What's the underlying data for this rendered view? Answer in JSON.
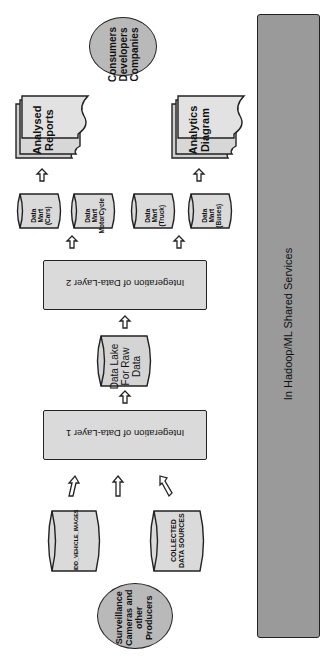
{
  "diagram": {
    "orientation": "rotated 90deg (text reads bottom-to-top / top-to-bottom)",
    "shared_services": {
      "label": "In Hadoop/ML Shared Services"
    },
    "consumers": {
      "label": "Consumers\nDevelopers\nCompanies"
    },
    "outputs": [
      {
        "label": "Analysed\nReports"
      },
      {
        "label": "Analytics\nDiagram"
      }
    ],
    "data_marts": [
      {
        "label": "Data\nMart\n(Cars)"
      },
      {
        "label": "Data\nMart\nMotorCycle"
      },
      {
        "label": "Data\nMart\n(Truck)"
      },
      {
        "label": "Data\nMart\n(Buses)"
      }
    ],
    "integration_layer_2": {
      "label": "Integeration of Data-Layer 2"
    },
    "data_lake": {
      "label": "Data Lake\nFor Raw\nData"
    },
    "integration_layer_1": {
      "label": "Integeration of Data-Layer 1"
    },
    "sources": [
      {
        "label": "IDD_VEHICLE_IMAGES"
      },
      {
        "label": "COLLECTED\nDATA SOURCES"
      }
    ],
    "producers": {
      "label": "Surveillance\nCameras and\nother\nProducers"
    }
  }
}
